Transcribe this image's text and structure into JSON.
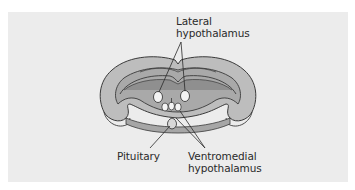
{
  "figure": {
    "type": "anatomical cross-section diagram",
    "colors": {
      "panel_background": "#ececec",
      "tissue_outer": "#bdbdbd",
      "tissue_inner": "#a9a9a9",
      "tissue_dark": "#8f8f8f",
      "outline": "#3a3a3a",
      "nucleus_fill": "#f4f4f4",
      "pituitary_fill": "#d8d8d8"
    }
  },
  "labels": {
    "lateral": {
      "line1": "Lateral",
      "line2": "hypothalamus"
    },
    "pituitary": {
      "line1": "Pituitary"
    },
    "ventromedial": {
      "line1": "Ventromedial",
      "line2": "hypothalamus"
    }
  }
}
